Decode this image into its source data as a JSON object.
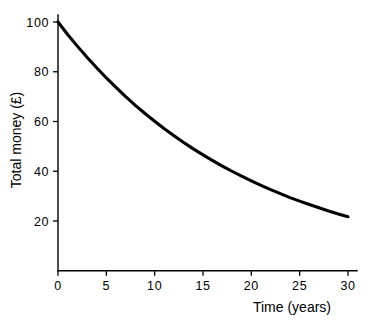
{
  "chart_data": {
    "type": "line",
    "title": "",
    "xlabel": "Time (years)",
    "ylabel": "Total money  (£)",
    "xlim": [
      0,
      30
    ],
    "ylim": [
      0,
      100
    ],
    "grid": false,
    "legend": "none",
    "xticks": [
      "0",
      "5",
      "10",
      "15",
      "20",
      "25",
      "30"
    ],
    "xtick_values": [
      0,
      5,
      10,
      15,
      20,
      25,
      30
    ],
    "yticks": [
      "20",
      "40",
      "60",
      "80",
      "100"
    ],
    "ytick_values": [
      20,
      40,
      60,
      80,
      100
    ],
    "series": [
      {
        "name": "Total money",
        "x": [
          0,
          1,
          2,
          3,
          4,
          5,
          6,
          7,
          8,
          9,
          10,
          11,
          12,
          13,
          14,
          15,
          16,
          17,
          18,
          19,
          20,
          21,
          22,
          23,
          24,
          25,
          26,
          27,
          28,
          29,
          30
        ],
        "values": [
          100.0,
          95.0,
          90.3,
          85.8,
          81.6,
          77.5,
          73.7,
          70.0,
          66.5,
          63.2,
          60.1,
          57.1,
          54.3,
          51.6,
          49.0,
          46.6,
          44.3,
          42.1,
          40.0,
          38.0,
          36.1,
          34.3,
          32.6,
          31.0,
          29.4,
          28.0,
          26.6,
          25.3,
          24.0,
          22.8,
          21.7
        ]
      }
    ],
    "annotations": []
  }
}
